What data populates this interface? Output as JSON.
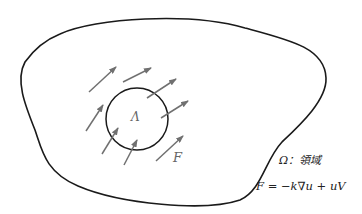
{
  "diagram": {
    "region_label": "Ω：領域",
    "circle_label": "Λ",
    "flux_label": "F",
    "equation": "F = −k∇u + uV",
    "colors": {
      "outline": "#1a1a1a",
      "arrow": "#707070",
      "background": "#ffffff"
    },
    "arrows": [
      {
        "x1": 89,
        "y1": 92,
        "x2": 116,
        "y2": 67
      },
      {
        "x1": 123,
        "y1": 82,
        "x2": 151,
        "y2": 68
      },
      {
        "x1": 147,
        "y1": 98,
        "x2": 176,
        "y2": 79
      },
      {
        "x1": 86,
        "y1": 131,
        "x2": 103,
        "y2": 105
      },
      {
        "x1": 161,
        "y1": 118,
        "x2": 188,
        "y2": 101
      },
      {
        "x1": 102,
        "y1": 154,
        "x2": 118,
        "y2": 128
      },
      {
        "x1": 124,
        "y1": 165,
        "x2": 137,
        "y2": 140
      },
      {
        "x1": 156,
        "y1": 161,
        "x2": 183,
        "y2": 136
      }
    ]
  }
}
